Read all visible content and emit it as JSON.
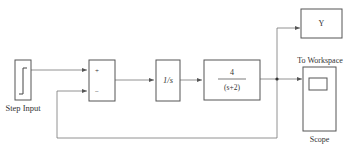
{
  "diagram": {
    "type": "simulink-block-diagram",
    "blocks": {
      "step": {
        "label": "Step Input",
        "icon": "step-function-icon"
      },
      "sum": {
        "plus": "+",
        "minus": "−"
      },
      "integrator": {
        "expr": "1/s"
      },
      "transfer_fn": {
        "numerator": "4",
        "denominator": "(s+2)"
      },
      "to_workspace": {
        "label": "To Workspace",
        "var": "Y"
      },
      "scope": {
        "label": "Scope",
        "icon": "scope-screen-icon"
      }
    },
    "colors": {
      "block_stroke": "#555555",
      "wire": "#777777",
      "background": "#ffffff"
    }
  }
}
